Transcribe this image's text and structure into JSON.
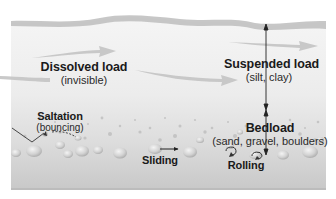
{
  "diagram": {
    "type": "river-sediment-transport",
    "colors": {
      "background": "#ffffff",
      "water_top": "#f4f4f4",
      "water_mid": "#e6e6e6",
      "water_bottom": "#c9c9c9",
      "surface_band": "#b9b9b9",
      "flow_arrow": "#c2c2c2",
      "pebble": "#d6d6d6",
      "pebble_highlight": "#f2f2f2",
      "text": "#1a1a1a",
      "arrow_line": "#222222"
    },
    "labels": {
      "dissolved": {
        "title": "Dissolved load",
        "sub": "(invisible)"
      },
      "suspended": {
        "title": "Suspended load",
        "sub": "(silt, clay)"
      },
      "bedload": {
        "title": "Bedload",
        "sub": "(sand, gravel, boulders)"
      },
      "saltation": {
        "title": "Saltation",
        "sub": "(bouncing)"
      },
      "sliding": {
        "title": "Sliding"
      },
      "rolling": {
        "title": "Rolling"
      }
    }
  }
}
